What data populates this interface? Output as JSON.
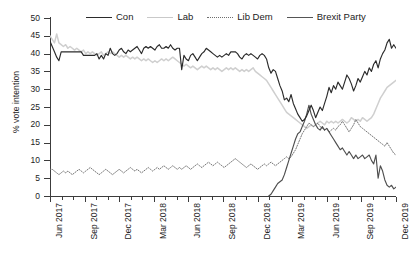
{
  "chart_data": {
    "type": "line",
    "title": "",
    "xlabel": "",
    "ylabel": "% vote intention",
    "ylim": [
      0,
      50
    ],
    "ytick_values": [
      0,
      5,
      10,
      15,
      20,
      25,
      30,
      35,
      40,
      45,
      50
    ],
    "xlim": [
      "Jun 2017",
      "Dec 2019"
    ],
    "xtick_labels": [
      "Jun 2017",
      "Sep 2017",
      "Dec 2017",
      "Mar 2018",
      "Jun 2018",
      "Sep 2018",
      "Dec 2018",
      "Mar 2019",
      "Jun 2019",
      "Sep 2019",
      "Dec 2019"
    ],
    "grid": false,
    "legend_position": "top",
    "legend": [
      "Con",
      "Lab",
      "Lib Dem",
      "Brexit Party"
    ],
    "colors": {
      "Con": "#2b2b2b",
      "Lab": "#cfcfcf",
      "Lib Dem": "#6e6e6e",
      "Brexit Party": "#4f4f4f"
    },
    "line_styles": {
      "Con": "solid",
      "Lab": "solid",
      "Lib Dem": "dotted",
      "Brexit Party": "solid"
    },
    "x_index_note": "index 0 = Jun 2017, 1 unit = 1 poll step, 31 months span, ~5 polls per month",
    "n_points": 156,
    "series": [
      {
        "name": "Con",
        "values": [
          43.5,
          42.0,
          40.5,
          39.0,
          38.0,
          40.5,
          40.5,
          40.5,
          40.5,
          40.5,
          40.5,
          40.5,
          40.5,
          40.5,
          40.5,
          39.5,
          39.5,
          39.5,
          39.5,
          39.5,
          39.5,
          40.0,
          38.5,
          39.5,
          38.5,
          40.0,
          39.5,
          41.5,
          40.0,
          39.5,
          40.0,
          41.0,
          41.5,
          40.5,
          40.0,
          41.0,
          40.5,
          41.0,
          41.5,
          42.0,
          41.0,
          40.0,
          41.5,
          42.0,
          41.5,
          42.0,
          41.5,
          41.0,
          42.0,
          42.5,
          41.5,
          41.5,
          42.0,
          41.5,
          42.5,
          41.5,
          41.0,
          41.5,
          41.5,
          35.5,
          39.5,
          38.5,
          38.0,
          39.5,
          40.0,
          39.0,
          38.0,
          39.0,
          40.0,
          40.5,
          41.5,
          41.0,
          40.5,
          40.0,
          39.5,
          39.0,
          39.5,
          39.0,
          39.5,
          40.0,
          39.5,
          40.5,
          40.5,
          40.5,
          40.0,
          39.0,
          38.5,
          39.5,
          40.0,
          39.5,
          40.0,
          39.5,
          39.0,
          38.5,
          39.5,
          40.0,
          39.5,
          38.5,
          36.0,
          34.5,
          35.5,
          35.0,
          33.0,
          31.0,
          29.5,
          27.0,
          27.5,
          26.5,
          28.5,
          26.0,
          24.5,
          23.0,
          22.0,
          21.0,
          21.5,
          22.5,
          24.0,
          25.5,
          24.0,
          22.0,
          23.5,
          25.0,
          24.0,
          26.0,
          28.0,
          30.5,
          29.0,
          31.0,
          30.0,
          32.0,
          31.0,
          30.0,
          32.0,
          34.0,
          33.0,
          31.5,
          29.5,
          31.0,
          33.0,
          32.0,
          33.5,
          35.0,
          34.0,
          36.0,
          35.0,
          37.0,
          38.0,
          36.0,
          38.5,
          40.0,
          41.0,
          43.0,
          44.0,
          41.5,
          42.5,
          41.5
        ]
      },
      {
        "name": "Lab",
        "values": [
          45.0,
          44.0,
          43.0,
          45.5,
          43.0,
          42.5,
          42.0,
          42.5,
          41.5,
          42.0,
          41.5,
          41.0,
          41.5,
          41.0,
          40.5,
          41.0,
          40.0,
          40.5,
          40.0,
          40.5,
          40.0,
          39.5,
          40.0,
          40.5,
          39.5,
          40.0,
          40.5,
          40.0,
          40.5,
          40.0,
          39.5,
          39.0,
          39.5,
          39.0,
          39.5,
          39.0,
          38.5,
          39.0,
          38.5,
          39.0,
          38.5,
          38.0,
          38.5,
          38.0,
          38.5,
          38.0,
          37.5,
          38.0,
          37.5,
          38.0,
          38.5,
          38.0,
          38.5,
          38.0,
          38.5,
          39.0,
          38.5,
          38.0,
          37.5,
          37.0,
          36.5,
          37.0,
          36.5,
          36.0,
          36.5,
          36.0,
          35.5,
          36.0,
          36.5,
          36.0,
          36.5,
          36.0,
          35.5,
          36.0,
          35.5,
          36.0,
          35.5,
          35.0,
          35.5,
          36.0,
          35.5,
          36.0,
          35.5,
          36.0,
          35.5,
          35.0,
          35.5,
          35.0,
          35.5,
          35.0,
          35.5,
          36.0,
          35.0,
          34.5,
          34.0,
          33.5,
          33.0,
          32.5,
          31.5,
          30.5,
          29.5,
          28.5,
          27.5,
          26.5,
          25.5,
          24.5,
          23.5,
          23.0,
          22.5,
          22.0,
          21.5,
          21.0,
          20.5,
          20.0,
          19.5,
          19.0,
          19.5,
          20.0,
          19.5,
          20.0,
          20.5,
          21.0,
          20.5,
          20.0,
          21.0,
          20.5,
          21.0,
          20.5,
          21.0,
          20.5,
          21.0,
          21.5,
          21.0,
          20.5,
          21.0,
          22.0,
          21.5,
          21.0,
          21.5,
          21.0,
          22.0,
          21.5,
          21.0,
          21.5,
          22.0,
          23.0,
          24.5,
          26.0,
          27.5,
          28.5,
          29.5,
          30.5,
          31.0,
          31.5,
          32.0,
          32.5
        ]
      },
      {
        "name": "Lib Dem",
        "values": [
          7.5,
          7.5,
          7.0,
          6.5,
          6.0,
          6.5,
          7.0,
          6.5,
          7.0,
          6.5,
          6.0,
          6.5,
          7.0,
          7.5,
          7.0,
          6.5,
          7.0,
          7.5,
          8.0,
          7.5,
          7.0,
          6.5,
          6.0,
          6.5,
          7.0,
          7.5,
          7.0,
          6.5,
          6.0,
          6.5,
          7.0,
          7.5,
          7.0,
          6.5,
          7.0,
          7.5,
          8.0,
          7.5,
          7.0,
          7.5,
          7.0,
          6.5,
          7.0,
          7.5,
          8.0,
          7.5,
          7.0,
          7.5,
          8.0,
          7.5,
          8.0,
          8.5,
          8.0,
          7.5,
          8.0,
          8.5,
          8.0,
          7.5,
          8.0,
          7.5,
          8.0,
          8.5,
          8.0,
          7.5,
          8.0,
          8.5,
          9.0,
          8.5,
          8.0,
          8.5,
          9.0,
          9.5,
          9.0,
          8.5,
          9.0,
          9.5,
          9.0,
          8.5,
          8.0,
          8.5,
          9.0,
          9.5,
          10.0,
          10.5,
          10.0,
          9.5,
          9.0,
          8.5,
          8.0,
          8.5,
          9.0,
          8.5,
          8.0,
          7.5,
          8.0,
          8.5,
          9.0,
          8.5,
          9.0,
          9.5,
          9.0,
          8.5,
          9.0,
          9.5,
          10.0,
          10.5,
          11.0,
          10.5,
          11.0,
          12.0,
          13.0,
          14.5,
          16.0,
          17.5,
          18.5,
          19.5,
          20.5,
          20.0,
          19.5,
          20.0,
          20.5,
          19.5,
          19.0,
          18.5,
          19.0,
          18.0,
          18.5,
          19.0,
          18.5,
          19.5,
          20.0,
          21.0,
          20.0,
          19.0,
          18.0,
          19.0,
          20.0,
          21.5,
          20.5,
          19.5,
          19.0,
          18.5,
          18.0,
          17.5,
          17.0,
          16.5,
          16.0,
          15.5,
          15.0,
          14.5,
          14.0,
          15.0,
          14.0,
          13.0,
          12.0,
          11.5
        ]
      },
      {
        "name": "Brexit Party",
        "values": [
          null,
          null,
          null,
          null,
          null,
          null,
          null,
          null,
          null,
          null,
          null,
          null,
          null,
          null,
          null,
          null,
          null,
          null,
          null,
          null,
          null,
          null,
          null,
          null,
          null,
          null,
          null,
          null,
          null,
          null,
          null,
          null,
          null,
          null,
          null,
          null,
          null,
          null,
          null,
          null,
          null,
          null,
          null,
          null,
          null,
          null,
          null,
          null,
          null,
          null,
          null,
          null,
          null,
          null,
          null,
          null,
          null,
          null,
          null,
          null,
          null,
          null,
          null,
          null,
          null,
          null,
          null,
          null,
          null,
          null,
          null,
          null,
          null,
          null,
          null,
          null,
          null,
          null,
          null,
          null,
          null,
          null,
          null,
          null,
          null,
          null,
          null,
          null,
          null,
          null,
          null,
          null,
          null,
          null,
          null,
          null,
          null,
          null,
          0.0,
          0.5,
          1.5,
          2.5,
          3.5,
          4.0,
          4.5,
          6.0,
          8.0,
          10.0,
          12.0,
          14.0,
          16.0,
          17.5,
          18.0,
          19.5,
          21.0,
          23.0,
          25.5,
          23.0,
          21.5,
          20.0,
          19.0,
          18.5,
          19.5,
          18.5,
          19.0,
          18.0,
          17.0,
          16.0,
          15.0,
          14.0,
          13.0,
          13.5,
          12.5,
          11.5,
          12.5,
          11.5,
          10.5,
          11.5,
          10.5,
          11.0,
          11.5,
          10.5,
          11.0,
          11.5,
          10.0,
          9.0,
          11.5,
          5.0,
          8.5,
          7.0,
          4.5,
          3.0,
          2.5,
          3.0,
          2.0,
          2.5
        ]
      }
    ]
  },
  "legend": {
    "items": [
      {
        "label": "Con",
        "style": "solid-dark"
      },
      {
        "label": "Lab",
        "style": "solid-light"
      },
      {
        "label": "Lib Dem",
        "style": "dotted"
      },
      {
        "label": "Brexit Party",
        "style": "solid-mid"
      }
    ]
  },
  "axes": {
    "y_title": "% vote intention",
    "y_labels": [
      "50",
      "45",
      "40",
      "35",
      "30",
      "25",
      "20",
      "15",
      "10",
      "5",
      "0"
    ],
    "x_labels": [
      "Jun 2017",
      "Sep 2017",
      "Dec 2017",
      "Mar 2018",
      "Jun 2018",
      "Sep 2018",
      "Dec 2018",
      "Mar 2019",
      "Jun 2019",
      "Sep 2019",
      "Dec 2019"
    ]
  }
}
